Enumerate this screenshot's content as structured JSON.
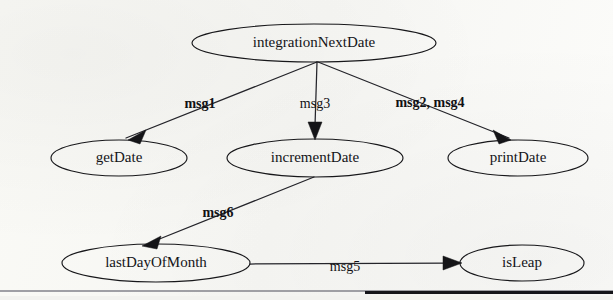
{
  "diagram": {
    "type": "call-graph",
    "background_color": "#fbfbf9",
    "stroke_color": "#17171a",
    "nodes": [
      {
        "id": "integrationNextDate",
        "label": "integrationNextDate",
        "cx": 314,
        "cy": 43,
        "rx": 122,
        "ry": 19
      },
      {
        "id": "getDate",
        "label": "getDate",
        "cx": 119,
        "cy": 158,
        "rx": 68,
        "ry": 18
      },
      {
        "id": "incrementDate",
        "label": "incrementDate",
        "cx": 315,
        "cy": 158,
        "rx": 88,
        "ry": 19
      },
      {
        "id": "printDate",
        "label": "printDate",
        "cx": 518,
        "cy": 158,
        "rx": 70,
        "ry": 18
      },
      {
        "id": "lastDayOfMonth",
        "label": "lastDayOfMonth",
        "cx": 156,
        "cy": 263,
        "rx": 94,
        "ry": 19
      },
      {
        "id": "isLeap",
        "label": "isLeap",
        "cx": 522,
        "cy": 263,
        "rx": 62,
        "ry": 18
      }
    ],
    "edges": [
      {
        "id": "edge-msg1",
        "label": "msg1",
        "from": "integrationNextDate",
        "to": "getDate",
        "label_x": 200,
        "label_y": 105,
        "weight": "bold"
      },
      {
        "id": "edge-msg3",
        "label": "msg3",
        "from": "integrationNextDate",
        "to": "incrementDate",
        "label_x": 315,
        "label_y": 105,
        "weight": "light"
      },
      {
        "id": "edge-msg2-msg4",
        "label": "msg2, msg4",
        "from": "integrationNextDate",
        "to": "printDate",
        "label_x": 430,
        "label_y": 104,
        "weight": "bold"
      },
      {
        "id": "edge-msg6",
        "label": "msg6",
        "from": "incrementDate",
        "to": "lastDayOfMonth",
        "label_x": 218,
        "label_y": 214,
        "weight": "bold"
      },
      {
        "id": "edge-msg5",
        "label": "msg5",
        "from": "lastDayOfMonth",
        "to": "isLeap",
        "label_x": 345,
        "label_y": 268,
        "weight": "light"
      }
    ],
    "footer_rule": {
      "present": true,
      "color_light": "#8f8f96",
      "color_dark": "#15151a"
    }
  }
}
